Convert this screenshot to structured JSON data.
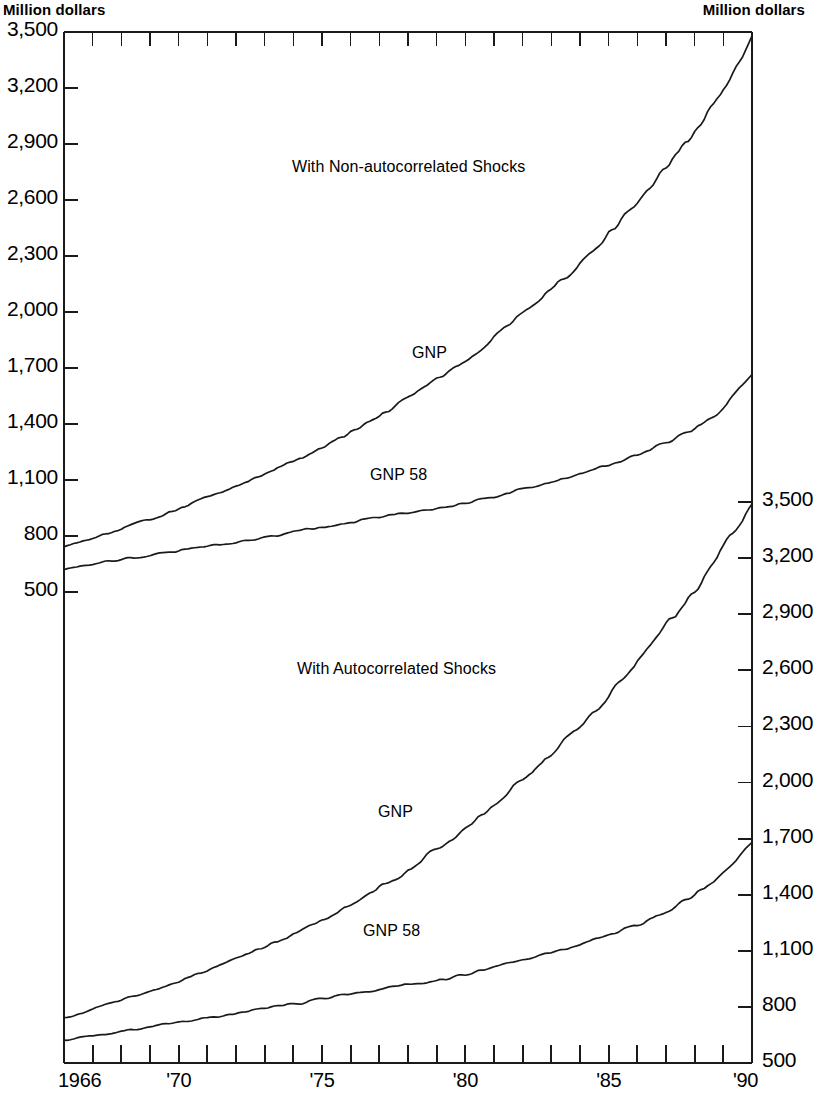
{
  "axis_unit_left": "Million dollars",
  "axis_unit_right": "Million dollars",
  "annotations": {
    "upper_panel": "With Non-autocorrelated Shocks",
    "lower_panel": "With Autocorrelated Shocks",
    "upper_gnp": "GNP",
    "upper_gnp58": "GNP 58",
    "lower_gnp": "GNP",
    "lower_gnp58": "GNP 58"
  },
  "left_axis_ticks": [
    "3,500",
    "3,200",
    "2,900",
    "2,600",
    "2,300",
    "2,000",
    "1,700",
    "1,400",
    "1,100",
    "800",
    "500"
  ],
  "right_axis_ticks": [
    "3,500",
    "3,200",
    "2,900",
    "2,600",
    "2,300",
    "2,000",
    "1,700",
    "1,400",
    "1,100",
    "800",
    "500"
  ],
  "x_axis_ticks": [
    "1966",
    "'70",
    "'75",
    "'80",
    "'85",
    "'90"
  ],
  "colors": {
    "line": "#1a1a1a",
    "axis": "#1a1a1a",
    "background": "#ffffff"
  },
  "chart_data": {
    "type": "line",
    "title": "",
    "subtitle": "",
    "xlabel": "",
    "ylabel": "Million dollars",
    "grid": false,
    "legend_position": "inline-annotations",
    "panels": [
      {
        "name": "With Non-autocorrelated Shocks",
        "ylim": [
          500,
          3500
        ],
        "ytick_values": [
          500,
          800,
          1100,
          1400,
          1700,
          2000,
          2300,
          2600,
          2900,
          3200,
          3500
        ],
        "y_axis_side": "left",
        "x": [
          1966,
          1967,
          1968,
          1969,
          1970,
          1971,
          1972,
          1973,
          1974,
          1975,
          1976,
          1977,
          1978,
          1979,
          1980,
          1981,
          1982,
          1983,
          1984,
          1985,
          1986,
          1987,
          1988,
          1989,
          1990
        ],
        "series": [
          {
            "name": "GNP",
            "values": [
              743,
              790,
              838,
              893,
              946,
              1002,
              1063,
              1130,
              1200,
              1276,
              1355,
              1440,
              1540,
              1640,
              1745,
              1860,
              1985,
              2120,
              2265,
              2420,
              2590,
              2770,
              2970,
              3200,
              3480
            ]
          },
          {
            "name": "GNP 58",
            "values": [
              620,
              650,
              675,
              700,
              722,
              745,
              770,
              795,
              820,
              845,
              872,
              900,
              925,
              945,
              975,
              1010,
              1050,
              1090,
              1130,
              1180,
              1235,
              1300,
              1380,
              1480,
              1665
            ]
          }
        ]
      },
      {
        "name": "With Autocorrelated Shocks",
        "ylim": [
          500,
          3500
        ],
        "ytick_values": [
          500,
          800,
          1100,
          1400,
          1700,
          2000,
          2300,
          2600,
          2900,
          3200,
          3500
        ],
        "y_axis_side": "right",
        "x": [
          1966,
          1967,
          1968,
          1969,
          1970,
          1971,
          1972,
          1973,
          1974,
          1975,
          1976,
          1977,
          1978,
          1979,
          1980,
          1981,
          1982,
          1983,
          1984,
          1985,
          1986,
          1987,
          1988,
          1989,
          1990
        ],
        "series": [
          {
            "name": "GNP",
            "values": [
              740,
              788,
              835,
              886,
              940,
              996,
              1055,
              1120,
              1190,
              1265,
              1345,
              1435,
              1535,
              1645,
              1760,
              1880,
              2010,
              2150,
              2300,
              2460,
              2640,
              2830,
              3030,
              3245,
              3490
            ]
          },
          {
            "name": "GNP 58",
            "values": [
              618,
              645,
              670,
              695,
              718,
              740,
              765,
              790,
              815,
              842,
              868,
              895,
              920,
              942,
              972,
              1008,
              1048,
              1088,
              1132,
              1182,
              1240,
              1310,
              1400,
              1510,
              1680
            ]
          }
        ]
      }
    ]
  }
}
